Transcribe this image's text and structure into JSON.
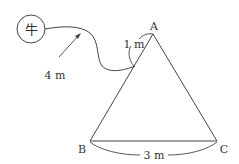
{
  "diagram": {
    "cow_label": "牛",
    "rope_label": "4 m",
    "segment_label": "1 m",
    "base_label": "3 m",
    "vertices": {
      "A": "A",
      "B": "B",
      "C": "C"
    },
    "colors": {
      "stroke": "#444444",
      "text": "#333333"
    }
  }
}
